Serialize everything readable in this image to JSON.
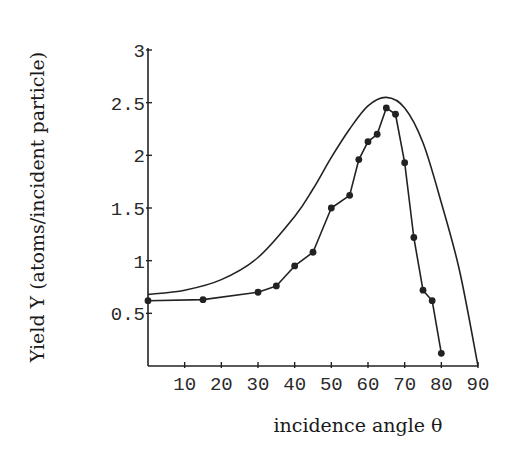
{
  "chart_data": {
    "type": "line",
    "title": "",
    "xlabel": "incidence angle θ",
    "ylabel": "Yield Y (atoms/incident particle)",
    "xlim": [
      0,
      90
    ],
    "ylim": [
      0,
      3
    ],
    "x_ticks": [
      10,
      20,
      30,
      40,
      50,
      60,
      70,
      80,
      90
    ],
    "y_ticks": [
      0.5,
      1,
      1.5,
      2,
      2.5,
      3
    ],
    "y_tick_labels": [
      "0.5",
      "1",
      "1.5",
      "2",
      "2.5",
      "3"
    ],
    "grid": false,
    "legend": null,
    "series": [
      {
        "name": "measured",
        "style": "line-with-markers",
        "x": [
          0,
          15,
          30,
          35,
          40,
          45,
          50,
          55,
          57.5,
          60,
          62.5,
          65,
          67.5,
          70,
          72.5,
          75,
          77.5,
          80
        ],
        "y": [
          0.62,
          0.63,
          0.7,
          0.76,
          0.95,
          1.08,
          1.5,
          1.62,
          1.96,
          2.13,
          2.2,
          2.45,
          2.39,
          1.93,
          1.22,
          0.72,
          0.62,
          0.12
        ]
      },
      {
        "name": "theory",
        "style": "smooth-line",
        "x": [
          0,
          10,
          20,
          30,
          40,
          45,
          50,
          55,
          60,
          65,
          70,
          75,
          80,
          85,
          90
        ],
        "y": [
          0.68,
          0.72,
          0.82,
          1.03,
          1.42,
          1.68,
          1.98,
          2.25,
          2.47,
          2.55,
          2.45,
          2.12,
          1.55,
          0.9,
          0.0
        ]
      }
    ]
  }
}
